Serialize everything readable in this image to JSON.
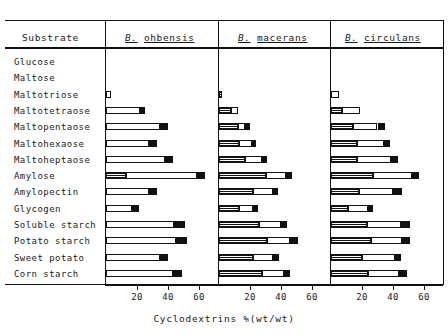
{
  "table": {
    "substrate_header": "Substrate",
    "species": [
      {
        "genus": "B.",
        "name": "ohbensis"
      },
      {
        "genus": "B.",
        "name": "macerans"
      },
      {
        "genus": "B.",
        "name": "circulans"
      }
    ]
  },
  "axis": {
    "label": "Cyclodextrins %(wt/wt)",
    "ticks": [
      "20",
      "40",
      "60"
    ],
    "tick_values": [
      20,
      40,
      60
    ],
    "min": 0,
    "max": 70
  },
  "legend_segments": {
    "alpha": "hatched-segment",
    "beta": "open-segment",
    "gamma": "solid-segment"
  },
  "chart_data": {
    "type": "bar",
    "title": "",
    "subtitle": "",
    "xlabel": "Cyclodextrins %(wt/wt)",
    "ylabel": "Substrate",
    "xlim": [
      0,
      70
    ],
    "grid": false,
    "legend_position": "none",
    "orientation": "horizontal",
    "stacked": true,
    "categories": [
      "Glucose",
      "Maltose",
      "Maltotriose",
      "Maltotetraose",
      "Maltopentaose",
      "Maltohexaose",
      "Maltoheptaose",
      "Amylose",
      "Amylopectin",
      "Glycogen",
      "Soluble starch",
      "Potato starch",
      "Sweet potato",
      "Corn starch"
    ],
    "panels": [
      {
        "name": "B. ohbensis",
        "series": [
          {
            "name": "alpha-CD",
            "style": "hatched",
            "values": [
              0,
              0,
              0,
              0,
              0,
              0,
              0,
              13,
              0,
              0,
              0,
              0,
              0,
              0
            ]
          },
          {
            "name": "beta-CD",
            "style": "open",
            "values": [
              0,
              0,
              3,
              22,
              35,
              28,
              38,
              46,
              28,
              17,
              44,
              45,
              35,
              43
            ]
          },
          {
            "name": "gamma-CD",
            "style": "solid",
            "values": [
              0,
              0,
              0,
              3,
              5,
              5,
              5,
              5,
              5,
              4,
              7,
              7,
              5,
              6
            ]
          }
        ],
        "totals": [
          0,
          0,
          3,
          25,
          40,
          33,
          43,
          64,
          33,
          21,
          51,
          52,
          40,
          49
        ]
      },
      {
        "name": "B. macerans",
        "series": [
          {
            "name": "alpha-CD",
            "style": "hatched",
            "values": [
              0,
              0,
              2,
              8,
              12,
              13,
              17,
              30,
              22,
              13,
              26,
              31,
              22,
              28
            ]
          },
          {
            "name": "beta-CD",
            "style": "open",
            "values": [
              0,
              0,
              0,
              4,
              5,
              8,
              11,
              13,
              13,
              9,
              14,
              15,
              13,
              14
            ]
          },
          {
            "name": "gamma-CD",
            "style": "solid",
            "values": [
              0,
              0,
              0,
              0,
              3,
              3,
              3,
              4,
              3,
              3,
              4,
              5,
              4,
              4
            ]
          }
        ],
        "totals": [
          0,
          0,
          2,
          12,
          20,
          24,
          31,
          47,
          38,
          25,
          44,
          51,
          39,
          46
        ]
      },
      {
        "name": "B. circulans",
        "series": [
          {
            "name": "alpha-CD",
            "style": "hatched",
            "values": [
              0,
              0,
              0,
              7,
              14,
              17,
              17,
              27,
              18,
              11,
              23,
              26,
              20,
              24
            ]
          },
          {
            "name": "beta-CD",
            "style": "open",
            "values": [
              0,
              0,
              5,
              12,
              16,
              17,
              22,
              25,
              22,
              13,
              22,
              20,
              21,
              20
            ]
          },
          {
            "name": "gamma-CD",
            "style": "solid",
            "values": [
              0,
              0,
              0,
              0,
              5,
              4,
              4,
              5,
              6,
              3,
              6,
              5,
              4,
              5
            ]
          }
        ],
        "totals": [
          0,
          0,
          5,
          19,
          35,
          38,
          43,
          57,
          46,
          27,
          51,
          51,
          45,
          49
        ]
      }
    ]
  }
}
